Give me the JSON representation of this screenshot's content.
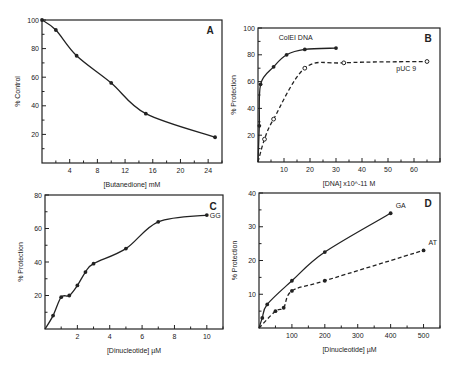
{
  "chart_data": [
    {
      "panel": "A",
      "type": "line",
      "title": "",
      "xlabel": "[Butanedione] mM",
      "ylabel": "% Control",
      "xlim": [
        0,
        26
      ],
      "ylim": [
        0,
        100
      ],
      "xticks": [
        4,
        8,
        12,
        16,
        20,
        24
      ],
      "yticks": [
        20,
        40,
        60,
        80,
        100
      ],
      "grid": false,
      "series": [
        {
          "name": "",
          "style": "solid",
          "x": [
            0,
            2,
            5,
            10,
            15,
            25
          ],
          "y": [
            100,
            93,
            75,
            56,
            34.5,
            18
          ]
        }
      ]
    },
    {
      "panel": "B",
      "type": "line",
      "title": "",
      "xlabel": "[DNA] x10^-11 M",
      "ylabel": "% Protection",
      "xlim": [
        0,
        70
      ],
      "ylim": [
        0,
        100
      ],
      "xticks": [
        10,
        20,
        30,
        40,
        50,
        60
      ],
      "yticks": [
        20,
        40,
        60,
        80,
        100
      ],
      "grid": false,
      "series": [
        {
          "name": "ColEI DNA",
          "style": "solid",
          "x": [
            0.5,
            1,
            6,
            11,
            18,
            30
          ],
          "y": [
            27,
            58,
            71,
            80,
            84,
            85
          ]
        },
        {
          "name": "pUC 9",
          "style": "dashed",
          "x": [
            2.5,
            6,
            18,
            33,
            65
          ],
          "y": [
            17,
            32,
            70,
            74,
            75
          ]
        }
      ]
    },
    {
      "panel": "C",
      "type": "line",
      "title": "",
      "xlabel": "[Dinucleotide] µM",
      "ylabel": "% Protection",
      "xlim": [
        0,
        11
      ],
      "ylim": [
        0,
        80
      ],
      "xticks": [
        2,
        4,
        6,
        8,
        10
      ],
      "yticks": [
        20,
        40,
        60,
        80
      ],
      "grid": false,
      "series": [
        {
          "name": "GG",
          "style": "solid",
          "x": [
            0.5,
            1,
            1.5,
            2,
            2.5,
            3,
            5,
            7,
            10
          ],
          "y": [
            8,
            19,
            20,
            26,
            34,
            39,
            48,
            64,
            68
          ]
        }
      ]
    },
    {
      "panel": "D",
      "type": "line",
      "title": "",
      "xlabel": "[Dinucleotide] µM",
      "ylabel": "% Protection",
      "xlim": [
        0,
        550
      ],
      "ylim": [
        0,
        40
      ],
      "xticks": [
        100,
        200,
        300,
        400,
        500
      ],
      "yticks": [
        10,
        20,
        30,
        40
      ],
      "grid": false,
      "series": [
        {
          "name": "GA",
          "style": "solid",
          "x": [
            10,
            25,
            100,
            200,
            400
          ],
          "y": [
            3,
            7,
            14,
            22.5,
            34
          ]
        },
        {
          "name": "AT",
          "style": "dashed",
          "x": [
            50,
            75,
            100,
            200,
            500
          ],
          "y": [
            5,
            6,
            11,
            14,
            23
          ]
        }
      ]
    }
  ]
}
